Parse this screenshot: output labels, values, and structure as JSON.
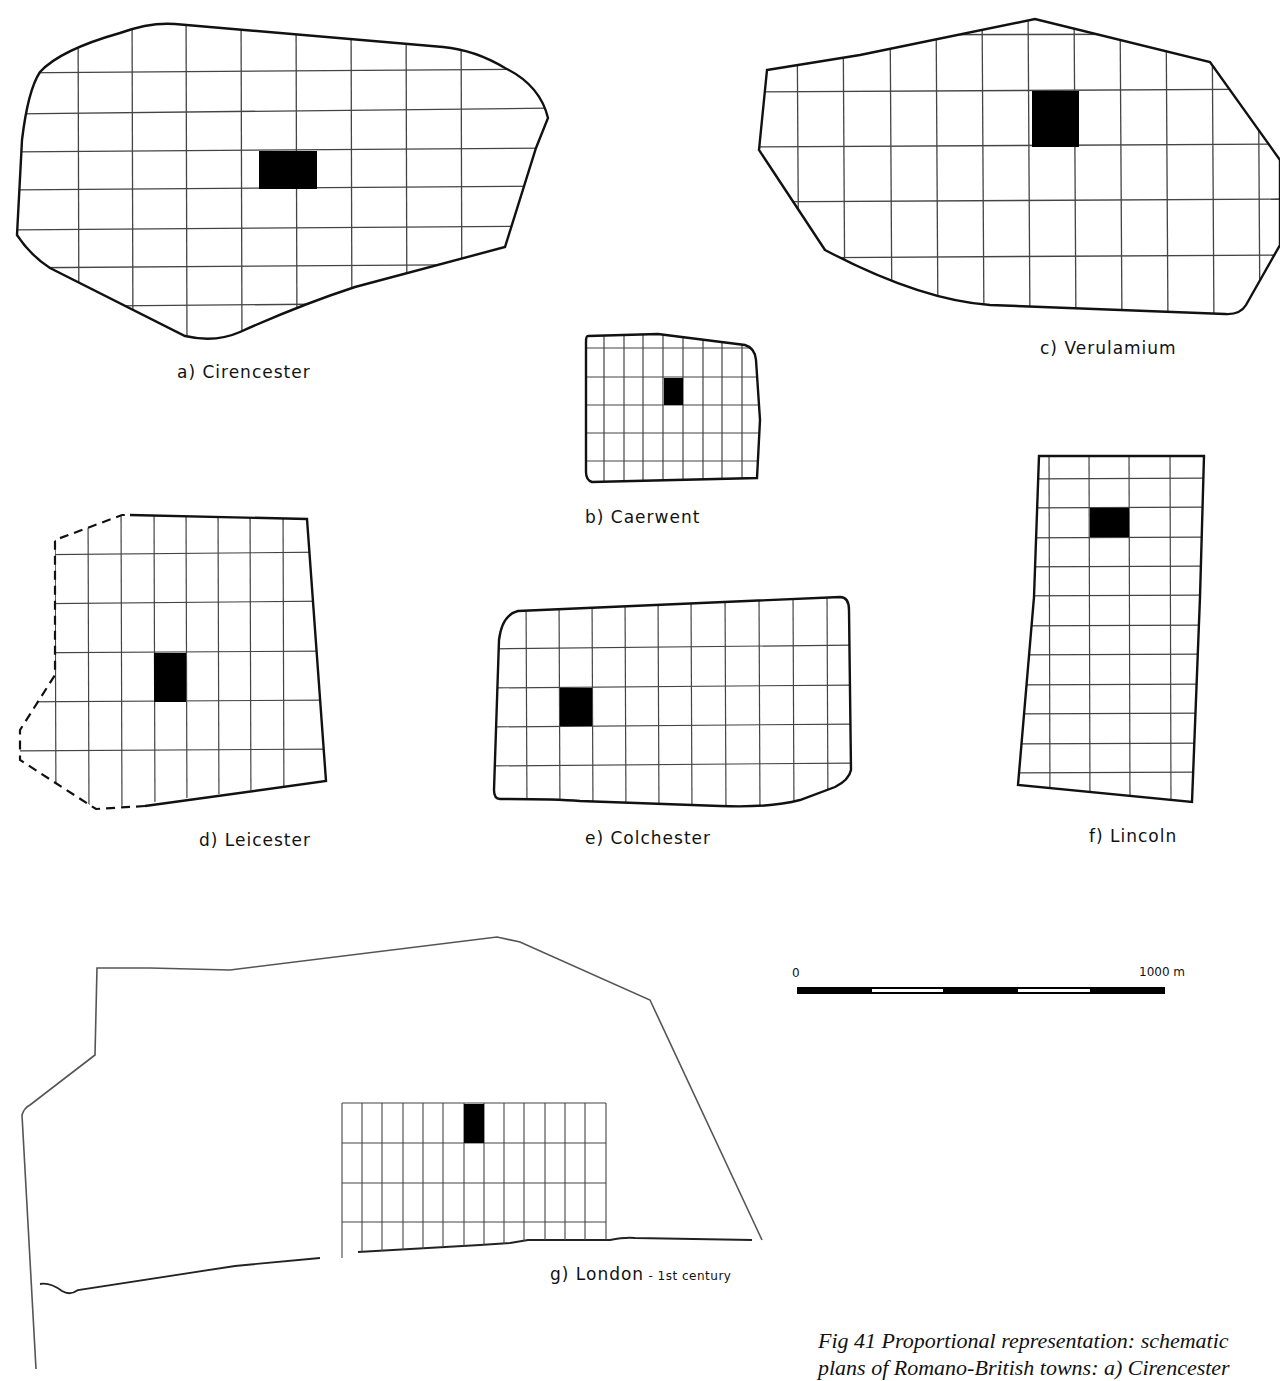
{
  "figure": {
    "caption_line1": "Fig 41   Proportional representation: schematic",
    "caption_line2": "plans of Romano-British towns:  a) Cirencester"
  },
  "towns": [
    {
      "id": "a",
      "label": "a)  Cirencester",
      "boundary": "solid"
    },
    {
      "id": "b",
      "label": "b)  Caerwent",
      "boundary": "solid"
    },
    {
      "id": "c",
      "label": "c)  Verulamium",
      "boundary": "solid"
    },
    {
      "id": "d",
      "label": "d)  Leicester",
      "boundary": "partly dashed (conjectural)"
    },
    {
      "id": "e",
      "label": "e)  Colchester",
      "boundary": "solid"
    },
    {
      "id": "f",
      "label": "f)  Lincoln",
      "boundary": "solid"
    },
    {
      "id": "g",
      "label": "g)  London",
      "label_suffix": " - 1st century",
      "boundary": "thin outline"
    }
  ],
  "scale_bar": {
    "start_label": "0",
    "end_label": "1000 m",
    "segments": 5
  },
  "colors": {
    "ink": "#111111",
    "grid": "#444444",
    "paper": "#ffffff"
  }
}
